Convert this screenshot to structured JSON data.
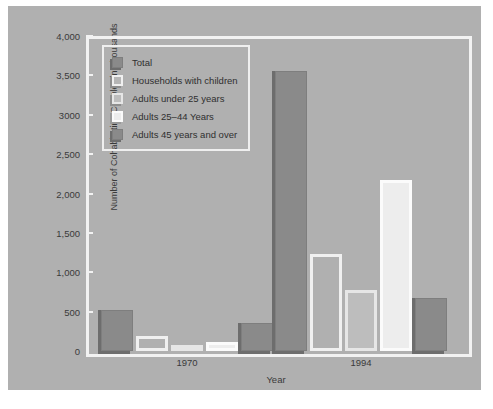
{
  "chart_data": {
    "type": "bar",
    "title": "",
    "xlabel": "Year",
    "ylabel": "Number of Cohabitating Couples in Thousands",
    "categories": [
      "1970",
      "1994"
    ],
    "ylim": [
      0,
      4000
    ],
    "yticks": [
      0,
      500,
      1000,
      1500,
      2000,
      2500,
      3000,
      3500,
      4000
    ],
    "ytick_labels": [
      "0",
      "500",
      "1,000",
      "1,500",
      "2,000",
      "2,500",
      "3000",
      "3,500",
      "4,000"
    ],
    "grid": false,
    "legend_position": "upper-left-inside",
    "series": [
      {
        "name": "Total",
        "values": [
          523,
          3550
        ],
        "swatch": "dark"
      },
      {
        "name": "Households with children",
        "values": [
          196,
          1236
        ],
        "swatch": "mid"
      },
      {
        "name": "Adults under 25 years",
        "values": [
          55,
          775
        ],
        "swatch": "light"
      },
      {
        "name": "Adults 25–44 Years",
        "values": [
          117,
          2175
        ],
        "swatch": "pale"
      },
      {
        "name": "Adults 45 years and over",
        "values": [
          351,
          673
        ],
        "swatch": "dark"
      }
    ]
  },
  "legend": {
    "items": [
      {
        "label": "Total",
        "swatch": "dark"
      },
      {
        "label": "Households with children",
        "swatch": "mid"
      },
      {
        "label": "Adults under 25 years",
        "swatch": "light"
      },
      {
        "label": "Adults 25–44 Years",
        "swatch": "pale"
      },
      {
        "label": "Adults 45 years and over",
        "swatch": "dark"
      }
    ]
  },
  "axes": {
    "y_title": "Number of Cohabitating Couples in Thousands",
    "x_title": "Year"
  },
  "caption": {
    "text": ""
  },
  "colors": {
    "canvas": "#b0b0b0",
    "frame": "#f2f2f2",
    "dark": "#8a8a8a",
    "mid": "#b6b6b6",
    "light": "#bdbdbd",
    "pale": "#ededed",
    "text": "#3a3a3a"
  }
}
